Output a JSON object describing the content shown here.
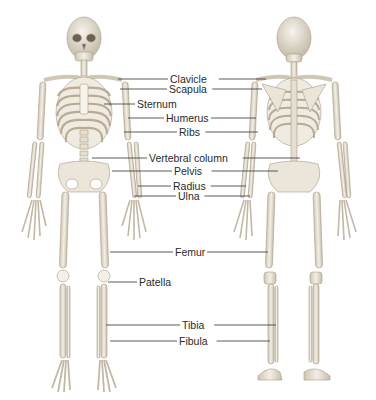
{
  "diagram": {
    "colors": {
      "bone": "#ece7dc",
      "bone_shadow": "#b9ad98",
      "dark": "#8d7f6a",
      "leader": "#333333",
      "text": "#2a2a2a"
    },
    "views": [
      "anterior",
      "posterior"
    ],
    "labels": [
      {
        "text": "Clavicle",
        "y": 79,
        "x": 170,
        "left_x": 118,
        "right_x": 266
      },
      {
        "text": "Scapula",
        "y": 89,
        "x": 169,
        "left_x": 120,
        "right_x": 262
      },
      {
        "text": "Sternum",
        "y": 104,
        "x": 137,
        "left_x": 104,
        "right_x": null
      },
      {
        "text": "Humerus",
        "y": 118,
        "x": 166,
        "left_x": 128,
        "right_x": 256
      },
      {
        "text": "Ribs",
        "y": 132,
        "x": 179,
        "left_x": 124,
        "right_x": 258
      },
      {
        "text": "Vertebral column",
        "y": 158,
        "x": 149,
        "left_x": 92,
        "right_x": 300
      },
      {
        "text": "Pelvis",
        "y": 171,
        "x": 174,
        "left_x": 112,
        "right_x": 278
      },
      {
        "text": "Radius",
        "y": 186,
        "x": 173,
        "left_x": 138,
        "right_x": 246
      },
      {
        "text": "Ulna",
        "y": 196,
        "x": 178,
        "left_x": 134,
        "right_x": 250
      },
      {
        "text": "Femur",
        "y": 252,
        "x": 175,
        "left_x": 110,
        "right_x": 268
      },
      {
        "text": "Patella",
        "y": 282,
        "x": 139,
        "left_x": 108,
        "right_x": null
      },
      {
        "text": "Tibia",
        "y": 325,
        "x": 182,
        "left_x": 106,
        "right_x": 276
      },
      {
        "text": "Fibula",
        "y": 341,
        "x": 179,
        "left_x": 110,
        "right_x": 270
      }
    ]
  }
}
